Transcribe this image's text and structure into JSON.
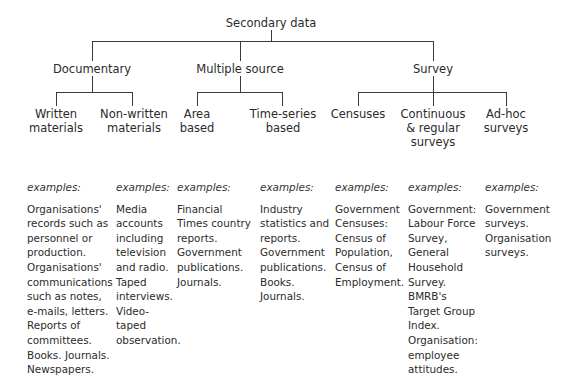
{
  "root": {
    "label": "Secondary data"
  },
  "categories": [
    {
      "label": "Documentary",
      "children": [
        {
          "label": "Written\nmaterials",
          "examples_label": "examples:",
          "examples": "Organisations'\nrecords such as\npersonnel or\nproduction.\nOrganisations'\ncommunications\nsuch as notes,\ne-mails, letters.\nReports of\ncommittees.\nBooks. Journals.\nNewspapers."
        },
        {
          "label": "Non-written\nmaterials",
          "examples_label": "examples:",
          "examples": "Media\naccounts\nincluding\ntelevision\nand radio.\nTaped\ninterviews.\nVideo-\ntaped\nobservation."
        }
      ]
    },
    {
      "label": "Multiple source",
      "children": [
        {
          "label": "Area\nbased",
          "examples_label": "examples:",
          "examples": "Financial\nTimes country\nreports.\nGovernment\npublications.\nJournals."
        },
        {
          "label": "Time-series\nbased",
          "examples_label": "examples:",
          "examples": "Industry\nstatistics and\nreports.\nGovernment\npublications.\nBooks.\nJournals."
        }
      ]
    },
    {
      "label": "Survey",
      "children": [
        {
          "label": "Censuses",
          "examples_label": "examples:",
          "examples": "Government\nCensuses:\nCensus of\nPopulation,\nCensus of\nEmployment."
        },
        {
          "label": "Continuous\n& regular\nsurveys",
          "examples_label": "examples:",
          "examples": "Government:\nLabour Force\nSurvey,\nGeneral\nHousehold\nSurvey.\nBMRB's\nTarget Group\nIndex.\nOrganisation:\nemployee\nattitudes."
        },
        {
          "label": "Ad-hoc\nsurveys",
          "examples_label": "examples:",
          "examples": "Government\nsurveys.\nOrganisation\nsurveys."
        }
      ]
    }
  ]
}
